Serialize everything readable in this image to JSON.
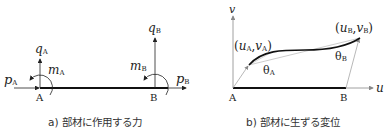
{
  "panel_a": {
    "caption": "a) 部材に作用する力",
    "node_a": "A",
    "node_b": "B",
    "labels": {
      "p_a": {
        "main": "p",
        "sub": "A"
      },
      "q_a": {
        "main": "q",
        "sub": "A"
      },
      "m_a": {
        "main": "m",
        "sub": "A"
      },
      "p_b": {
        "main": "p",
        "sub": "B"
      },
      "q_b": {
        "main": "q",
        "sub": "B"
      },
      "m_b": {
        "main": "m",
        "sub": "B"
      }
    }
  },
  "panel_b": {
    "caption": "b) 部材に生ずる変位",
    "axis_v": "v",
    "axis_u": "u",
    "node_a": "A",
    "node_b": "B",
    "point_a": {
      "open": "(",
      "u": "u",
      "u_sub": "A",
      "comma": ",",
      "v": "v",
      "v_sub": "A",
      "close": ")"
    },
    "point_b": {
      "open": "(",
      "u": "u",
      "u_sub": "B",
      "comma": ",",
      "v": "v",
      "v_sub": "B",
      "close": ")"
    },
    "theta_a": {
      "main": "θ",
      "sub": "A"
    },
    "theta_b": {
      "main": "θ",
      "sub": "B"
    }
  }
}
